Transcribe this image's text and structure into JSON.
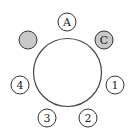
{
  "diagram": {
    "fill_color": "#c8c8c8",
    "seats": [
      {
        "id": "A",
        "label": "A",
        "filled": false
      },
      {
        "id": "C",
        "label": "C",
        "filled": true
      },
      {
        "id": "1",
        "label": "1",
        "filled": false
      },
      {
        "id": "2",
        "label": "2",
        "filled": false
      },
      {
        "id": "3",
        "label": "3",
        "filled": false
      },
      {
        "id": "4",
        "label": "4",
        "filled": false
      },
      {
        "id": "blank",
        "label": "",
        "filled": true
      }
    ]
  }
}
